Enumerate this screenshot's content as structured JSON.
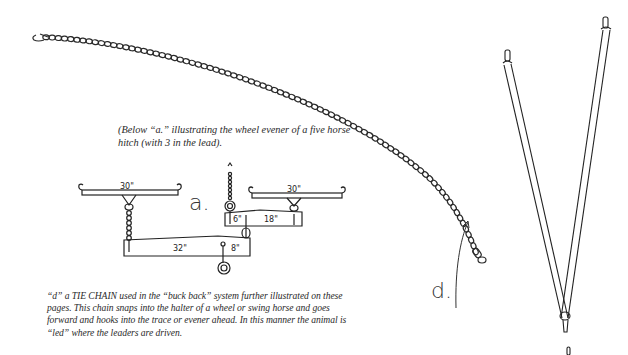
{
  "document": {
    "caption_a": "(Below “a.” illustrating the wheel evener of a five horse hitch (with 3 in the lead).",
    "caption_d": "“d” a TIE CHAIN used in the “buck back” system further illustrated on these pages. This chain snaps into the halter of a wheel or swing horse and goes forward and hooks into the trace or evener ahead. In this manner the animal is “led” where the leaders are driven."
  },
  "illustration_a": {
    "label": "a.",
    "dimensions": {
      "left_singletree": "30\"",
      "right_singletree": "30\"",
      "small_evener_short": "6\"",
      "small_evener_long": "18\"",
      "main_evener_long": "32\"",
      "main_evener_short": "8\""
    }
  },
  "illustration_d": {
    "label": "d."
  },
  "colors": {
    "ink": "#222222",
    "background": "#ffffff"
  }
}
